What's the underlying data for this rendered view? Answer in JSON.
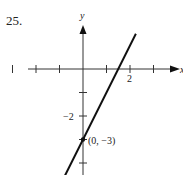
{
  "problem": {
    "number": "25."
  },
  "chart_data": {
    "type": "line",
    "title": "",
    "xlabel": "x",
    "ylabel": "y",
    "equation": "y = 2x - 3",
    "series": [
      {
        "name": "line",
        "points": [
          [
            -1.5,
            -6
          ],
          [
            2.25,
            1.5
          ]
        ]
      }
    ],
    "labeled_points": [
      {
        "x": 0,
        "y": -3,
        "label": "(0, −3)"
      }
    ],
    "x_ticks": [
      -3,
      -2,
      -1,
      1,
      2,
      3
    ],
    "x_tick_labels": [
      {
        "value": 2,
        "label": "2"
      }
    ],
    "y_ticks": [
      -1,
      -2,
      -3,
      -4
    ],
    "y_tick_labels": [
      {
        "value": -2,
        "label": "−2"
      }
    ],
    "xlim": [
      -3.5,
      4
    ],
    "ylim": [
      -4.5,
      1.6
    ],
    "grid": false,
    "legend": "none",
    "color": "#111111"
  }
}
